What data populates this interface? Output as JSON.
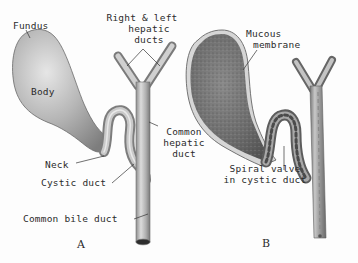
{
  "figure": {
    "panels": [
      {
        "id": "A",
        "letter": "A",
        "labels": {
          "fundus": "Fundus",
          "body": "Body",
          "neck": "Neck",
          "cystic_duct": "Cystic duct",
          "common_bile_duct": "Common bile duct",
          "hepatic_ducts_line1": "Right & left",
          "hepatic_ducts_line2": "hepatic",
          "hepatic_ducts_line3": "ducts",
          "common_hepatic_line1": "Common",
          "common_hepatic_line2": "hepatic",
          "common_hepatic_line3": "duct"
        }
      },
      {
        "id": "B",
        "letter": "B",
        "labels": {
          "mucous_line1": "Mucous",
          "mucous_line2": "membrane",
          "spiral_line1": "Spiral valve",
          "spiral_line2": "in cystic duct"
        }
      }
    ],
    "colors": {
      "background": "#fdfdfd",
      "gallbladder_light": "#d8d8d8",
      "gallbladder_dark": "#8a8a8a",
      "mucosa": "#6e6e6e",
      "duct": "#b8b8b8",
      "text": "#2b2b2b"
    }
  }
}
